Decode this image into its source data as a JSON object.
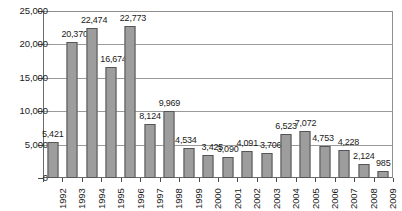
{
  "chart_data": {
    "type": "bar",
    "title": "",
    "subtitle": "",
    "xlabel": "",
    "ylabel": "",
    "grid": true,
    "legend": false,
    "ylim": [
      0,
      25000
    ],
    "ytick_values": [
      0,
      5000,
      10000,
      15000,
      20000,
      25000
    ],
    "ytick_labels": [
      "0",
      "5,000",
      "10,000",
      "15,000",
      "20,000",
      "25,000"
    ],
    "categories": [
      "1992",
      "1993",
      "1994",
      "1995",
      "1996",
      "1997",
      "1998",
      "1999",
      "2000",
      "2001",
      "2002",
      "2003",
      "2004",
      "2005",
      "2006",
      "2007",
      "2008",
      "2009"
    ],
    "values": [
      5421,
      20370,
      22474,
      16674,
      22773,
      8124,
      9969,
      4534,
      3425,
      3090,
      4091,
      3706,
      6523,
      7072,
      4753,
      4228,
      2124,
      985
    ],
    "data_labels": [
      "5,421",
      "20,370",
      "22,474",
      "16,674",
      "22,773",
      "8,124",
      "9,969",
      "4,534",
      "3,425",
      "3,090",
      "4,091",
      "3,706",
      "6,523",
      "7,072",
      "4,753",
      "4,228",
      "2,124",
      "985"
    ],
    "bar_color": "#9d9d9d",
    "bar_border_color": "#555555",
    "grid_color": "#9a9a9a",
    "axis_color": "#6b6b6b",
    "text_color": "#1a1a1a",
    "background": "#ffffff",
    "label_offsets": [
      {
        "dx": -1,
        "dy": -12
      },
      {
        "dx": -1,
        "dy": -12
      },
      {
        "dx": -1,
        "dy": -12
      },
      {
        "dx": -1,
        "dy": -12
      },
      {
        "dx": -1,
        "dy": -12
      },
      {
        "dx": -1,
        "dy": -12
      },
      {
        "dx": -1,
        "dy": -12
      },
      {
        "dx": -4,
        "dy": -12
      },
      {
        "dx": 3,
        "dy": -12
      },
      {
        "dx": -1,
        "dy": -12
      },
      {
        "dx": -1,
        "dy": -12
      },
      {
        "dx": 3,
        "dy": -12
      },
      {
        "dx": -1,
        "dy": -12
      },
      {
        "dx": -1,
        "dy": -12
      },
      {
        "dx": -3,
        "dy": -12
      },
      {
        "dx": 3,
        "dy": -12
      },
      {
        "dx": -1,
        "dy": -12
      },
      {
        "dx": 0,
        "dy": -12
      }
    ]
  }
}
